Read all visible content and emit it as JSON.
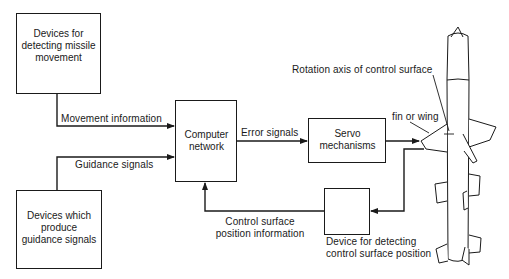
{
  "diagram": {
    "boxes": {
      "movement_detector": {
        "line1": "Devices for",
        "line2": "detecting missile",
        "line3": "movement"
      },
      "guidance_producer": {
        "line1": "Devices which",
        "line2": "produce",
        "line3": "guidance signals"
      },
      "computer": {
        "line1": "Computer",
        "line2": "network"
      },
      "servo": {
        "line1": "Servo",
        "line2": "mechanisms"
      },
      "position_detector": {
        "line1": "Device for detecting",
        "line2": "control surface position"
      }
    },
    "arrows": {
      "movement_info": "Movement information",
      "guidance_signals": "Guidance signals",
      "error_signals": "Error signals",
      "feedback": {
        "line1": "Control surface",
        "line2": "position information"
      }
    },
    "callouts": {
      "rotation_axis": "Rotation axis of control surface",
      "fin": "fin or wing"
    },
    "colors": {
      "line": "#1a1a1a",
      "background": "#ffffff"
    }
  }
}
